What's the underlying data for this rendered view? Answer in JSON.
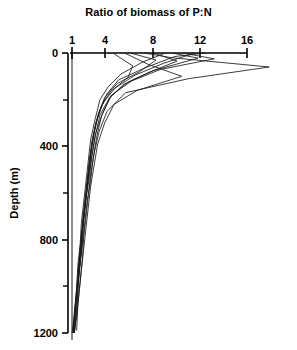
{
  "chart_data": {
    "type": "line",
    "title": "Ratio of biomass of P:N",
    "xlabel": "",
    "ylabel": "Depth (m)",
    "orientation": "vertical-profile",
    "grid": false,
    "legend": null,
    "xlim": [
      1,
      16
    ],
    "ylim": [
      0,
      1200
    ],
    "x_ticks": [
      1,
      4,
      8,
      12,
      16
    ],
    "x_tick_labels": [
      "1",
      "4",
      "8",
      "12",
      "16"
    ],
    "y_ticks": [
      0,
      400,
      800,
      1200
    ],
    "y_tick_labels": [
      "0",
      "400",
      "800",
      "1200"
    ],
    "y_minor_ticks": [
      200,
      600,
      1000
    ],
    "x_axis_position": "top",
    "y_axis_direction": "inverted",
    "reference_line_x": 1,
    "series": [
      {
        "name": "profile-1",
        "x": [
          7.2,
          9.5,
          17.9,
          11.0,
          5.6,
          4.0,
          3.3,
          2.9,
          2.6,
          2.4,
          2.2,
          2.0,
          1.9,
          1.7,
          1.5,
          1.4
        ],
        "y": [
          0,
          20,
          60,
          110,
          170,
          250,
          340,
          430,
          520,
          610,
          700,
          790,
          880,
          980,
          1080,
          1190
        ]
      },
      {
        "name": "profile-2",
        "x": [
          10.5,
          13.2,
          8.6,
          6.1,
          4.4,
          3.6,
          3.0,
          2.7,
          2.5,
          2.2,
          2.0,
          1.8,
          1.6,
          1.5,
          1.3,
          1.2
        ],
        "y": [
          0,
          25,
          70,
          120,
          180,
          260,
          350,
          440,
          530,
          620,
          710,
          800,
          890,
          990,
          1090,
          1195
        ]
      },
      {
        "name": "profile-3",
        "x": [
          6.0,
          8.2,
          6.8,
          4.9,
          3.8,
          3.2,
          2.8,
          2.5,
          2.3,
          2.1,
          1.9,
          1.8,
          1.6,
          1.4,
          1.3,
          1.1
        ],
        "y": [
          0,
          30,
          80,
          130,
          190,
          270,
          360,
          450,
          540,
          630,
          720,
          810,
          900,
          1000,
          1100,
          1200
        ]
      },
      {
        "name": "profile-4",
        "x": [
          9.0,
          7.0,
          5.2,
          4.1,
          3.4,
          3.0,
          2.6,
          2.4,
          2.2,
          2.0,
          1.8,
          1.7,
          1.5,
          1.4,
          1.2,
          1.1
        ],
        "y": [
          0,
          40,
          90,
          145,
          200,
          280,
          370,
          460,
          550,
          640,
          730,
          820,
          910,
          1010,
          1110,
          1200
        ]
      },
      {
        "name": "profile-5",
        "x": [
          8.0,
          10.0,
          7.5,
          5.4,
          4.2,
          3.5,
          3.1,
          2.8,
          2.6,
          2.3,
          2.1,
          1.9,
          1.7,
          1.5,
          1.4,
          1.2
        ],
        "y": [
          0,
          35,
          85,
          135,
          195,
          275,
          365,
          455,
          545,
          635,
          725,
          815,
          905,
          1005,
          1105,
          1200
        ]
      },
      {
        "name": "profile-6",
        "x": [
          11.5,
          8.8,
          6.4,
          4.7,
          3.7,
          3.1,
          2.7,
          2.5,
          2.3,
          2.1,
          1.9,
          1.7,
          1.6,
          1.4,
          1.2,
          1.0
        ],
        "y": [
          0,
          45,
          95,
          150,
          210,
          290,
          380,
          470,
          560,
          650,
          740,
          830,
          920,
          1020,
          1120,
          1200
        ]
      },
      {
        "name": "profile-7",
        "x": [
          5.5,
          7.6,
          10.4,
          6.6,
          4.6,
          3.8,
          3.2,
          2.9,
          2.6,
          2.4,
          2.2,
          2.0,
          1.8,
          1.6,
          1.4,
          1.2
        ],
        "y": [
          0,
          50,
          100,
          160,
          220,
          300,
          390,
          480,
          570,
          660,
          750,
          840,
          930,
          1030,
          1130,
          1200
        ]
      },
      {
        "name": "profile-8",
        "x": [
          12.5,
          9.8,
          7.2,
          5.0,
          4.0,
          3.3,
          2.9,
          2.6,
          2.4,
          2.2,
          2.0,
          1.8,
          1.7,
          1.5,
          1.3,
          1.1
        ],
        "y": [
          0,
          15,
          65,
          115,
          175,
          255,
          345,
          435,
          525,
          615,
          705,
          795,
          885,
          985,
          1085,
          1195
        ]
      },
      {
        "name": "profile-9",
        "x": [
          4.5,
          6.2,
          5.8,
          4.3,
          3.5,
          3.0,
          2.7,
          2.5,
          2.3,
          2.1,
          1.9,
          1.8,
          1.6,
          1.5,
          1.3,
          1.2
        ],
        "y": [
          0,
          55,
          105,
          165,
          230,
          310,
          400,
          490,
          580,
          670,
          760,
          850,
          940,
          1040,
          1140,
          1200
        ]
      },
      {
        "name": "profile-10",
        "x": [
          9.6,
          11.8,
          8.0,
          5.8,
          4.3,
          3.4,
          3.0,
          2.7,
          2.4,
          2.2,
          2.0,
          1.9,
          1.7,
          1.5,
          1.3,
          1.1
        ],
        "y": [
          0,
          22,
          75,
          125,
          185,
          265,
          355,
          445,
          535,
          625,
          715,
          805,
          895,
          995,
          1095,
          1200
        ]
      }
    ]
  }
}
